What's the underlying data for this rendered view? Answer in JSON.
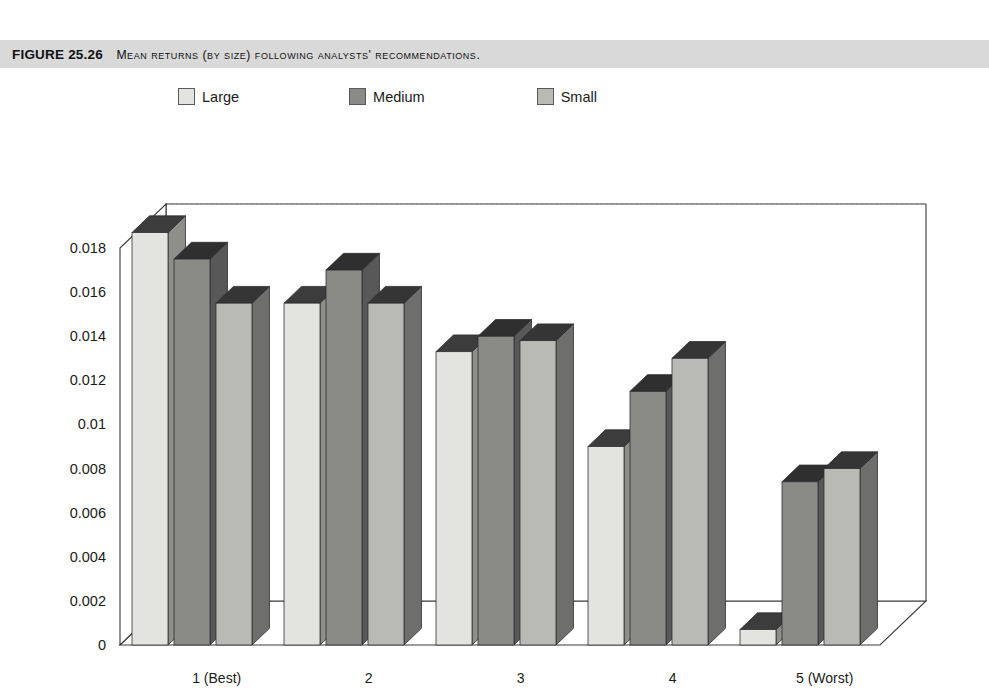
{
  "caption": {
    "figure_number": "FIGURE 25.26",
    "title": "Mean returns (by size) following analysts' recommendations."
  },
  "legend": {
    "position": "top",
    "items": [
      {
        "label": "Large",
        "color": "#e3e3e0",
        "side_color": "#8e8e8b",
        "top_color": "#3c3c3c"
      },
      {
        "label": "Medium",
        "color": "#8a8a87",
        "side_color": "#58585a",
        "top_color": "#2f2f2f"
      },
      {
        "label": "Small",
        "color": "#b9b9b6",
        "side_color": "#6e6e6c",
        "top_color": "#353535"
      }
    ]
  },
  "axes": {
    "y_ticks": [
      "0",
      "0.002",
      "0.004",
      "0.006",
      "0.008",
      "0.01",
      "0.012",
      "0.014",
      "0.016",
      "0.018"
    ],
    "x_ticks": [
      "1 (Best)",
      "2",
      "3",
      "4",
      "5 (Worst)"
    ],
    "ylim": [
      0,
      0.018
    ],
    "grid": true
  },
  "chart_data": {
    "type": "bar",
    "title": "Mean returns (by size) following analysts' recommendations.",
    "xlabel": "",
    "ylabel": "",
    "ylim": [
      0,
      0.018
    ],
    "grid": true,
    "legend_position": "top",
    "categories": [
      "1 (Best)",
      "2",
      "3",
      "4",
      "5 (Worst)"
    ],
    "series": [
      {
        "name": "Large",
        "values": [
          0.0187,
          0.0155,
          0.0133,
          0.009,
          0.0007
        ]
      },
      {
        "name": "Medium",
        "values": [
          0.0175,
          0.017,
          0.014,
          0.0115,
          0.0074
        ]
      },
      {
        "name": "Small",
        "values": [
          0.0155,
          0.0155,
          0.0138,
          0.013,
          0.008
        ]
      }
    ]
  }
}
